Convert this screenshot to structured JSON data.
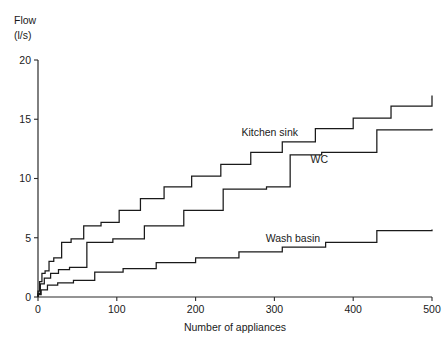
{
  "chart_data": {
    "type": "line",
    "title": "",
    "subtitle": "",
    "xlabel": "Number of appliances",
    "ylabel": "Flow",
    "ylabel_unit": "(l/s)",
    "xlim": [
      0,
      500
    ],
    "ylim": [
      0,
      20
    ],
    "xticks": [
      0,
      100,
      200,
      300,
      400,
      500
    ],
    "yticks": [
      0,
      5,
      10,
      15,
      20
    ],
    "xtick_labels": [
      "0",
      "100",
      "200",
      "300",
      "400",
      "500"
    ],
    "ytick_labels": [
      "0",
      "5",
      "10",
      "15",
      "20"
    ],
    "grid": false,
    "legend": "inline-annotations",
    "line_color": "#1a1a1a",
    "step_type": "post",
    "series": [
      {
        "name": "Kitchen sink",
        "label_x": 330,
        "label_y": 13.6,
        "x": [
          0,
          2,
          5,
          9,
          14,
          20,
          30,
          42,
          58,
          80,
          103,
          130,
          160,
          195,
          232,
          270,
          310,
          352,
          400,
          448,
          500
        ],
        "values": [
          0.5,
          1.3,
          2.0,
          2.2,
          3.0,
          3.3,
          4.6,
          4.9,
          6.0,
          6.3,
          7.3,
          8.3,
          9.3,
          10.2,
          11.2,
          12.2,
          13.1,
          14.2,
          15.1,
          16.1,
          17.0
        ]
      },
      {
        "name": "WC",
        "label_x": 368,
        "label_y": 11.3,
        "x": [
          0,
          3,
          8,
          16,
          26,
          40,
          62,
          95,
          135,
          185,
          235,
          290,
          320,
          360,
          430,
          500
        ],
        "values": [
          0.3,
          1.1,
          1.6,
          2.0,
          2.3,
          2.5,
          4.6,
          4.9,
          6.0,
          7.3,
          9.1,
          9.3,
          12.0,
          12.2,
          14.1,
          14.2
        ]
      },
      {
        "name": "Wash basin",
        "label_x": 358,
        "label_y": 4.6,
        "x": [
          0,
          4,
          12,
          25,
          45,
          72,
          108,
          150,
          200,
          255,
          310,
          365,
          430,
          500
        ],
        "values": [
          0.2,
          0.6,
          1.0,
          1.2,
          1.4,
          2.1,
          2.4,
          2.9,
          3.3,
          3.8,
          4.2,
          4.6,
          5.6,
          5.7
        ]
      }
    ]
  }
}
